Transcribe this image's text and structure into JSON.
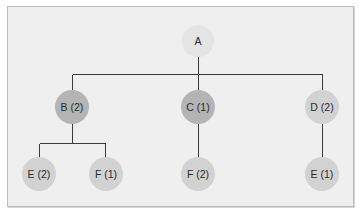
{
  "diagram": {
    "type": "tree",
    "colors": {
      "background": "#efefef",
      "border": "#bdbdbd",
      "edge": "#3a3a3a",
      "root": "#e4e4e4",
      "level1_dark": "#b4b4b4",
      "level1_light": "#d2d2d2",
      "leaf": "#d2d2d2",
      "text": "#2b2b2b"
    },
    "nodes": [
      {
        "id": "A",
        "label": "A",
        "cx": 198,
        "cy": 41,
        "r": 16,
        "fill": "#e4e4e4"
      },
      {
        "id": "B",
        "label": "B (2)",
        "cx": 72,
        "cy": 107,
        "r": 17,
        "fill": "#b4b4b4"
      },
      {
        "id": "C",
        "label": "C (1)",
        "cx": 198,
        "cy": 107,
        "r": 17,
        "fill": "#b4b4b4"
      },
      {
        "id": "D",
        "label": "D (2)",
        "cx": 322,
        "cy": 107,
        "r": 17,
        "fill": "#d2d2d2"
      },
      {
        "id": "BE",
        "label": "E (2)",
        "cx": 39,
        "cy": 174,
        "r": 17,
        "fill": "#d2d2d2"
      },
      {
        "id": "BF",
        "label": "F (1)",
        "cx": 106,
        "cy": 174,
        "r": 17,
        "fill": "#d2d2d2"
      },
      {
        "id": "CF",
        "label": "F (2)",
        "cx": 198,
        "cy": 174,
        "r": 17,
        "fill": "#d2d2d2"
      },
      {
        "id": "DE",
        "label": "E (1)",
        "cx": 322,
        "cy": 174,
        "r": 17,
        "fill": "#d2d2d2"
      }
    ],
    "edges": [
      {
        "from": "A",
        "to": [
          "B",
          "C",
          "D"
        ]
      },
      {
        "from": "B",
        "to": [
          "BE",
          "BF"
        ]
      },
      {
        "from": "C",
        "to": [
          "CF"
        ]
      },
      {
        "from": "D",
        "to": [
          "DE"
        ]
      }
    ]
  }
}
